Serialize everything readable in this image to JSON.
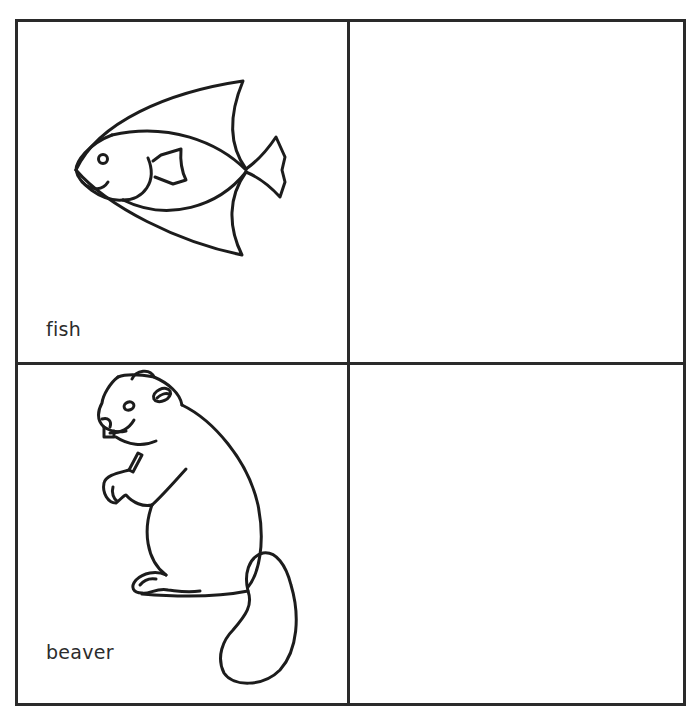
{
  "worksheet": {
    "layout": "2x2 grid",
    "cells": [
      {
        "position": "top-left",
        "picture": "fish-illustration",
        "label": "fish"
      },
      {
        "position": "top-right",
        "picture": "",
        "label": ""
      },
      {
        "position": "bottom-left",
        "picture": "beaver-illustration",
        "label": "beaver"
      },
      {
        "position": "bottom-right",
        "picture": "",
        "label": ""
      }
    ],
    "colors": {
      "line": "#2a2a2a",
      "paper": "#ffffff",
      "text": "#2c2c2c"
    }
  }
}
